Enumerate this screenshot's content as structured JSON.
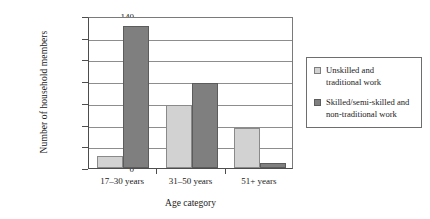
{
  "chart_data": {
    "type": "bar",
    "title": "",
    "xlabel": "Age category",
    "ylabel": "Number of household members",
    "categories": [
      "17–30 years",
      "31–50 years",
      "51+ years"
    ],
    "series": [
      {
        "name": "Unskilled and traditional work",
        "name_line1": "Unskilled and",
        "name_line2": "traditional work",
        "color": "#d2d2d2",
        "values": [
          11,
          58,
          37
        ]
      },
      {
        "name": "Skilled/semi-skilled and non-traditional work",
        "name_line1": "Skilled/semi-skilled and",
        "name_line2": "non-traditional work",
        "color": "#7f7f7f",
        "values": [
          131,
          78,
          5
        ]
      }
    ],
    "ylim": [
      0,
      140
    ],
    "yticks": [
      0,
      20,
      40,
      60,
      80,
      100,
      120,
      140
    ],
    "ytick_labels": [
      "0",
      "20",
      "40",
      "60",
      "80",
      "100",
      "120",
      "140"
    ],
    "grid": true,
    "legend_position": "right"
  }
}
